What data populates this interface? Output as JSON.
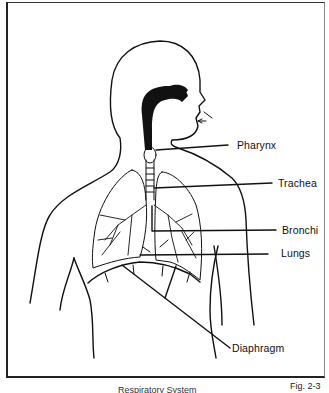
{
  "figure": {
    "caption": "Respiratory System",
    "number": "Fig. 2-3"
  },
  "labels": [
    {
      "id": "pharynx",
      "text": "Pharynx"
    },
    {
      "id": "trachea",
      "text": "Trachea"
    },
    {
      "id": "bronchi",
      "text": "Bronchi"
    },
    {
      "id": "lungs",
      "text": "Lungs"
    },
    {
      "id": "diaphragm",
      "text": "Diaphragm"
    }
  ],
  "colors": {
    "line": "#111111",
    "background": "#ffffff"
  }
}
